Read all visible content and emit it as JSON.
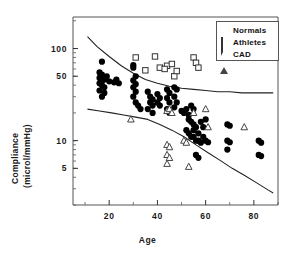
{
  "figure": {
    "background_color": "#ffffff",
    "frame_color": "#555555"
  },
  "axes": {
    "x": {
      "label": "Age",
      "ticks": [
        "20",
        "40",
        "60",
        "80"
      ],
      "tick_values": [
        20,
        40,
        60,
        80
      ],
      "range": [
        5,
        90
      ],
      "minor_ticks": [
        10,
        30,
        50,
        70,
        90
      ]
    },
    "y": {
      "label_line1": "Compliance",
      "label_line2": "(microl/mmHg)",
      "ticks": [
        "100",
        "50",
        "10",
        "5"
      ],
      "tick_values": [
        100,
        50,
        10,
        5
      ],
      "scale": "log",
      "range": [
        2,
        220
      ]
    }
  },
  "legend": {
    "position": "top-right",
    "entries": [
      {
        "label": "Normals",
        "marker": "filled-circle",
        "color": "#000000"
      },
      {
        "label": "Athletes",
        "marker": "open-square",
        "color": "#333333"
      },
      {
        "label": "CAD",
        "marker": "open-triangle",
        "color": "#444444"
      }
    ]
  },
  "chart_data": {
    "type": "scatter",
    "title": "",
    "xlabel": "Age",
    "ylabel": "Compliance (microl/mmHg)",
    "xlim": [
      5,
      90
    ],
    "ylim": [
      2,
      220
    ],
    "yscale": "log",
    "xscale": "linear",
    "grid": false,
    "legend_position": "top-right",
    "series": [
      {
        "name": "Normals",
        "marker": "filled-circle",
        "color": "#000000",
        "points": [
          [
            17,
            72
          ],
          [
            16,
            55
          ],
          [
            17,
            52
          ],
          [
            16,
            48
          ],
          [
            17,
            45
          ],
          [
            16,
            42
          ],
          [
            17,
            40
          ],
          [
            18,
            38
          ],
          [
            16,
            35
          ],
          [
            18,
            46
          ],
          [
            19,
            50
          ],
          [
            20,
            44
          ],
          [
            22,
            43
          ],
          [
            23,
            46
          ],
          [
            24,
            42
          ],
          [
            17,
            30
          ],
          [
            18,
            33
          ],
          [
            30,
            66
          ],
          [
            30,
            62
          ],
          [
            31,
            50
          ],
          [
            30,
            45
          ],
          [
            31,
            41
          ],
          [
            30,
            38
          ],
          [
            31,
            34
          ],
          [
            30,
            30
          ],
          [
            31,
            26
          ],
          [
            32,
            24
          ],
          [
            33,
            22
          ],
          [
            36,
            34
          ],
          [
            37,
            30
          ],
          [
            38,
            28
          ],
          [
            37,
            26
          ],
          [
            38,
            24
          ],
          [
            36,
            22
          ],
          [
            38,
            20
          ],
          [
            40,
            32
          ],
          [
            41,
            29
          ],
          [
            40,
            26
          ],
          [
            41,
            24
          ],
          [
            44,
            36
          ],
          [
            45,
            33
          ],
          [
            44,
            29
          ],
          [
            45,
            26
          ],
          [
            44,
            22
          ],
          [
            45,
            20
          ],
          [
            47,
            38
          ],
          [
            48,
            36
          ],
          [
            47,
            30
          ],
          [
            48,
            26
          ],
          [
            47,
            23
          ],
          [
            50,
            21
          ],
          [
            51,
            20
          ],
          [
            52,
            22
          ],
          [
            53,
            19
          ],
          [
            54,
            24
          ],
          [
            55,
            22
          ],
          [
            53,
            17
          ],
          [
            54,
            16
          ],
          [
            55,
            15
          ],
          [
            56,
            14
          ],
          [
            55,
            13
          ],
          [
            52,
            13
          ],
          [
            53,
            12
          ],
          [
            54,
            11
          ],
          [
            55,
            11
          ],
          [
            56,
            10
          ],
          [
            57,
            12
          ],
          [
            58,
            16
          ],
          [
            59,
            14
          ],
          [
            60,
            17
          ],
          [
            59,
            11
          ],
          [
            57,
            10
          ],
          [
            58,
            9.5
          ],
          [
            56,
            7
          ],
          [
            57,
            6.5
          ],
          [
            60,
            10
          ],
          [
            61,
            9.6
          ],
          [
            69,
            15
          ],
          [
            70,
            14.5
          ],
          [
            69,
            10
          ],
          [
            70,
            9.6
          ],
          [
            69,
            8
          ],
          [
            82,
            10
          ],
          [
            83,
            9.5
          ],
          [
            82,
            7
          ],
          [
            83,
            6.8
          ]
        ]
      },
      {
        "name": "Athletes",
        "marker": "open-square",
        "color": "#333333",
        "points": [
          [
            31,
            80
          ],
          [
            39,
            82
          ],
          [
            41,
            62
          ],
          [
            44,
            65
          ],
          [
            46,
            68
          ],
          [
            47,
            50
          ],
          [
            48,
            57
          ],
          [
            55,
            80
          ],
          [
            56,
            70
          ],
          [
            57,
            62
          ],
          [
            35,
            58
          ],
          [
            43,
            60
          ]
        ]
      },
      {
        "name": "CAD",
        "marker": "open-triangle",
        "color": "#444444",
        "points": [
          [
            29,
            17
          ],
          [
            44,
            21
          ],
          [
            45,
            22
          ],
          [
            46,
            20
          ],
          [
            44,
            9
          ],
          [
            45,
            8.5
          ],
          [
            44,
            7
          ],
          [
            45,
            6.5
          ],
          [
            44,
            5.6
          ],
          [
            51,
            10
          ],
          [
            52,
            9.5
          ],
          [
            53,
            5.2
          ],
          [
            55,
            20
          ],
          [
            60,
            22
          ],
          [
            61,
            14
          ],
          [
            76,
            14
          ]
        ]
      }
    ],
    "reference_curves": [
      {
        "name": "upper-boundary",
        "points": [
          [
            11,
            135
          ],
          [
            15,
            105
          ],
          [
            20,
            82
          ],
          [
            25,
            65
          ],
          [
            30,
            54
          ],
          [
            35,
            46
          ],
          [
            40,
            42
          ],
          [
            45,
            39
          ],
          [
            50,
            37
          ],
          [
            55,
            36
          ],
          [
            60,
            35
          ],
          [
            65,
            34
          ],
          [
            70,
            34
          ],
          [
            75,
            33
          ],
          [
            80,
            33
          ],
          [
            85,
            33
          ],
          [
            88,
            33
          ]
        ]
      },
      {
        "name": "lower-boundary",
        "points": [
          [
            11,
            22
          ],
          [
            16,
            21
          ],
          [
            21,
            20
          ],
          [
            26,
            19
          ],
          [
            31,
            18
          ],
          [
            36,
            17
          ],
          [
            41,
            15
          ],
          [
            46,
            13
          ],
          [
            51,
            11
          ],
          [
            56,
            9
          ],
          [
            61,
            7.4
          ],
          [
            66,
            6.1
          ],
          [
            71,
            5.0
          ],
          [
            76,
            4.2
          ],
          [
            81,
            3.5
          ],
          [
            86,
            2.9
          ],
          [
            88,
            2.7
          ]
        ]
      }
    ]
  },
  "caption_fragment": ""
}
